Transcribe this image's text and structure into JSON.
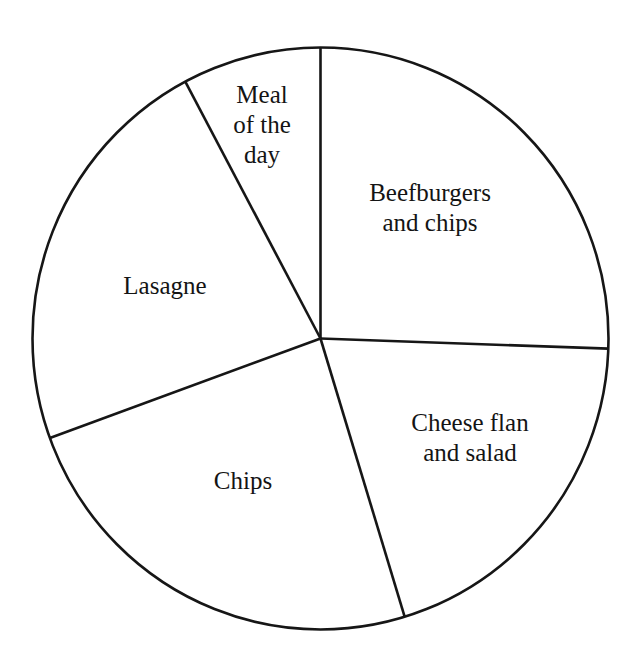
{
  "chart_data": {
    "type": "pie",
    "title": "",
    "subtitle": "",
    "xlabel": "",
    "ylabel": "",
    "legend_position": "none",
    "grid": false,
    "labels_inside_slices": true,
    "center": {
      "x": 320.5,
      "y": 338.5
    },
    "radius_x": 288,
    "radius_y": 291,
    "start_angle_deg_from_12_oclock": 0,
    "direction": "clockwise",
    "categories": [
      "Beefburgers and chips",
      "Cheese flan and salad",
      "Chips",
      "Lasagne",
      "Meal of the day"
    ],
    "values": [
      92,
      71,
      87,
      82,
      28
    ],
    "units": "degrees",
    "percentages": [
      25.6,
      19.7,
      24.2,
      22.8,
      7.8
    ],
    "slices": [
      {
        "name": "Beefburgers and chips",
        "start_deg": 0,
        "end_deg": 92,
        "sweep_deg": 92,
        "percent": 25.6,
        "label_lines": [
          "Beefburgers",
          "and chips"
        ],
        "label_x": 430,
        "label_y": 210,
        "fill": "#ffffff"
      },
      {
        "name": "Cheese flan and salad",
        "start_deg": 92,
        "end_deg": 163,
        "sweep_deg": 71,
        "percent": 19.7,
        "label_lines": [
          "Cheese flan",
          "and salad"
        ],
        "label_x": 470,
        "label_y": 440,
        "fill": "#ffffff"
      },
      {
        "name": "Chips",
        "start_deg": 163,
        "end_deg": 250,
        "sweep_deg": 87,
        "percent": 24.2,
        "label_lines": [
          "Chips"
        ],
        "label_x": 243,
        "label_y": 483,
        "fill": "#ffffff"
      },
      {
        "name": "Lasagne",
        "start_deg": 250,
        "end_deg": 332,
        "sweep_deg": 82,
        "percent": 22.8,
        "label_lines": [
          "Lasagne"
        ],
        "label_x": 165,
        "label_y": 288,
        "fill": "#ffffff"
      },
      {
        "name": "Meal of the day",
        "start_deg": 332,
        "end_deg": 360,
        "sweep_deg": 28,
        "percent": 7.8,
        "label_lines": [
          "Meal",
          "of the",
          "day"
        ],
        "label_x": 262,
        "label_y": 127,
        "fill": "#ffffff"
      }
    ],
    "boundary_points": [
      {
        "name": "top",
        "x": 320,
        "y": 47
      },
      {
        "name": "right",
        "x": 608,
        "y": 348
      },
      {
        "name": "bottom-right",
        "x": 403,
        "y": 620
      },
      {
        "name": "left-lower",
        "x": 55,
        "y": 432
      },
      {
        "name": "upper-left",
        "x": 156,
        "y": 105
      }
    ],
    "style": {
      "outline_color": "#161616",
      "divider_color": "#161616",
      "background": "#ffffff",
      "line_width": 2.6,
      "label_color": "#141414",
      "label_font_size": 25
    }
  }
}
